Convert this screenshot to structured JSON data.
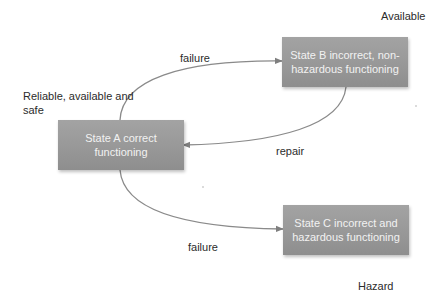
{
  "diagram": {
    "type": "state-transition",
    "states": [
      {
        "id": "A",
        "label": "State A correct functioning",
        "annotation": "Reliable, available and safe"
      },
      {
        "id": "B",
        "label": "State B incorrect, non-hazardous functioning",
        "annotation": "Available"
      },
      {
        "id": "C",
        "label": "State C incorrect and hazardous functioning",
        "annotation": "Hazard"
      }
    ],
    "transitions": [
      {
        "from": "A",
        "to": "B",
        "label": "failure"
      },
      {
        "from": "B",
        "to": "A",
        "label": "repair"
      },
      {
        "from": "A",
        "to": "C",
        "label": "failure"
      }
    ],
    "colors": {
      "box_fill": "#9a9a9a",
      "box_text": "#f2f2f2",
      "edge": "#7f7f7f",
      "label_text": "#2b2b2b"
    }
  },
  "labels": {
    "state_a": "State A correct functioning",
    "state_b": "State B incorrect, non-hazardous functioning",
    "state_c": "State C incorrect and hazardous functioning",
    "annotation_a": "Reliable, available and safe",
    "annotation_b": "Available",
    "annotation_c": "Hazard",
    "edge_a_to_b": "failure",
    "edge_b_to_a": "repair",
    "edge_a_to_c": "failure"
  }
}
